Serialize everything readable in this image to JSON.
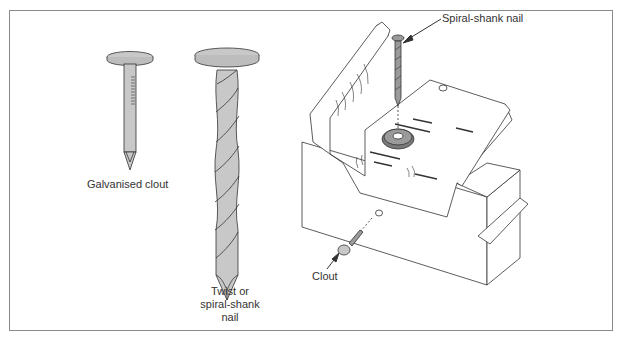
{
  "diagram": {
    "colors": {
      "frame": "#8a8a8a",
      "line": "#333333",
      "nail_fill": "#c8c8c8",
      "washer_fill": "#7a7a7a",
      "label_text": "#333333"
    },
    "labels": {
      "galvanised_clout": "Galvanised clout",
      "twist_nail_line1": "Twist or",
      "twist_nail_line2": "spiral-shank",
      "twist_nail_line3": "nail",
      "spiral_shank_nail": "Spiral-shank nail",
      "clout": "Clout"
    },
    "components": [
      {
        "id": "galvanised-clout",
        "type": "nail-illustration"
      },
      {
        "id": "twist-nail",
        "type": "nail-illustration"
      },
      {
        "id": "roof-clip-assembly",
        "type": "isometric-illustration",
        "parts": [
          "timber-block",
          "metal-clip",
          "washer",
          "spiral-shank-nail",
          "clout"
        ]
      }
    ]
  }
}
